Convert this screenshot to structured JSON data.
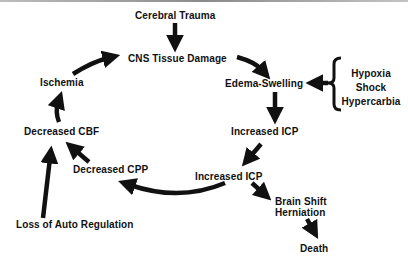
{
  "diagram": {
    "type": "flowchart-cycle",
    "colors": {
      "ink": "#111111",
      "background": "#ffffff",
      "border": "#9a9a9a"
    },
    "nodes": {
      "cerebral_trauma": "Cerebral Trauma",
      "cns_tissue_damage": "CNS Tissue Damage",
      "edema_swelling": "Edema-Swelling",
      "increased_icp_1": "Increased  ICP",
      "increased_icp_2": "Increased ICP",
      "decreased_cpp": "Decreased CPP",
      "decreased_cbf": "Decreased CBF",
      "ischemia": "Ischemia",
      "loss_of_auto_regulation": "Loss of Auto Regulation",
      "brain_shift": "Brain Shift",
      "herniation": "Herniation",
      "death": "Death",
      "contributors": [
        "Hypoxia",
        "Shock",
        "Hypercarbia"
      ]
    },
    "edges": [
      {
        "from": "Cerebral Trauma",
        "to": "CNS Tissue Damage"
      },
      {
        "from": "CNS Tissue Damage",
        "to": "Edema-Swelling"
      },
      {
        "from": "Hypoxia / Shock / Hypercarbia",
        "to": "Edema-Swelling"
      },
      {
        "from": "Edema-Swelling",
        "to": "Increased ICP"
      },
      {
        "from": "Increased ICP",
        "to": "Increased ICP"
      },
      {
        "from": "Increased ICP",
        "to": "Decreased CPP"
      },
      {
        "from": "Increased ICP",
        "to": "Brain Shift Herniation"
      },
      {
        "from": "Brain Shift Herniation",
        "to": "Death"
      },
      {
        "from": "Decreased CPP",
        "to": "Decreased CBF"
      },
      {
        "from": "Loss of Auto Regulation",
        "to": "Decreased CBF"
      },
      {
        "from": "Decreased CBF",
        "to": "Ischemia"
      },
      {
        "from": "Ischemia",
        "to": "CNS Tissue Damage"
      }
    ]
  }
}
